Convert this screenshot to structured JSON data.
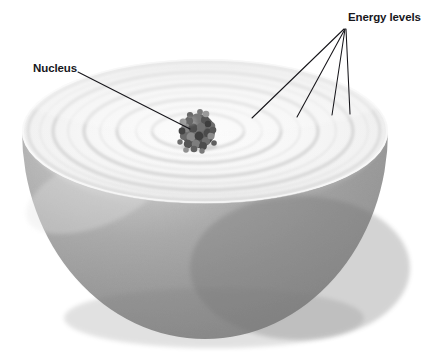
{
  "figure": {
    "background_color": "#ffffff",
    "width": 428,
    "height": 352
  },
  "labels": {
    "nucleus": {
      "text": "Nucleus",
      "x": 33,
      "y": 72,
      "anchor": "start",
      "color": "#18171c"
    },
    "energy_levels": {
      "text": "Energy levels",
      "x": 348,
      "y": 21,
      "anchor": "start",
      "color": "#18171c"
    }
  },
  "leader_lines": {
    "nucleus_line": {
      "x1": 78,
      "y1": 72,
      "x2": 190,
      "y2": 129
    },
    "energy_level_lines": [
      {
        "x1": 344,
        "y1": 29,
        "x2": 252,
        "y2": 118
      },
      {
        "x1": 345,
        "y1": 29,
        "x2": 297,
        "y2": 117
      },
      {
        "x1": 345,
        "y1": 29,
        "x2": 332,
        "y2": 115
      },
      {
        "x1": 346,
        "y1": 29,
        "x2": 350,
        "y2": 114
      }
    ]
  },
  "sphere": {
    "center_x": 205,
    "center_y": 131,
    "top_radius_x": 183,
    "top_radius_y": 72,
    "bottom_y": 339,
    "top_surface_color": "#f3f3f3",
    "hemisphere_color": "#9a9a9a",
    "hemisphere_shadow_color": "#7d7d7d",
    "hemisphere_highlight_color": "#d8d8d8",
    "rim_color": "#e8e8e8"
  },
  "nucleus": {
    "center_x": 198,
    "center_y": 131,
    "radius": 17,
    "color": "#5c5c5c",
    "color_dark": "#3a3a3a",
    "color_light": "#8f8f8f",
    "nucleon_count": 42
  },
  "energy_rings": {
    "count": 5,
    "color": "#c9c9c9",
    "radii_x": [
      46,
      82,
      117,
      150,
      176
    ],
    "radii_y": [
      18,
      32,
      46,
      59,
      69
    ]
  }
}
